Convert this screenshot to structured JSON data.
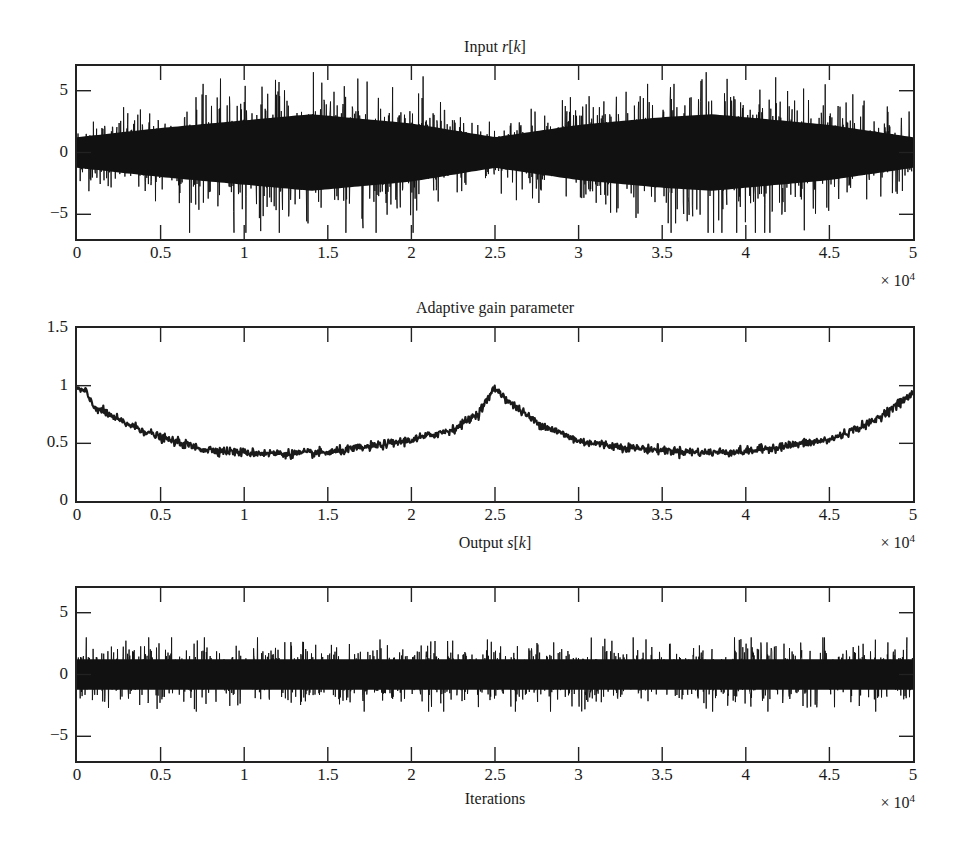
{
  "chart_data": [
    {
      "type": "line",
      "title": "Input r[k]",
      "title_parts": {
        "prefix": "Input ",
        "var": "r",
        "suffix_open": "[",
        "index": "k",
        "suffix_close": "]"
      },
      "xlabel": "",
      "ylabel": "",
      "x_multiplier": "× 10^4",
      "xlim": [
        0,
        5
      ],
      "ylim": [
        -7,
        7
      ],
      "xticks": [
        "0",
        "0.5",
        "1",
        "1.5",
        "2",
        "2.5",
        "3",
        "3.5",
        "4",
        "4.5",
        "5"
      ],
      "yticks": [
        "5",
        "0",
        "−5"
      ],
      "ytick_values": [
        5,
        0,
        -5
      ],
      "grid": false,
      "description": "Dense noise signal with amplitude envelope that grows to ~±5 near x=1.4 and x=3.7 (×10^4), shrinks to ~±2 near x=0, 2.5, 5",
      "envelope": {
        "x": [
          0,
          0.5,
          1.0,
          1.4,
          2.0,
          2.5,
          3.0,
          3.5,
          3.8,
          4.5,
          5.0
        ],
        "amplitude": [
          2.0,
          3.2,
          4.2,
          5.0,
          3.8,
          2.0,
          3.6,
          4.6,
          5.0,
          3.6,
          2.0
        ],
        "peak_max": 6.5,
        "peak_min": -6.3
      }
    },
    {
      "type": "line",
      "title": "Adaptive gain parameter",
      "xlabel": "",
      "ylabel": "",
      "x_multiplier": "× 10^4",
      "xlim": [
        0,
        5
      ],
      "ylim": [
        0,
        1.5
      ],
      "xticks": [
        "0",
        "0.5",
        "1",
        "1.5",
        "2",
        "2.5",
        "3",
        "3.5",
        "4",
        "4.5",
        "5"
      ],
      "yticks": [
        "1.5",
        "1",
        "0.5",
        "0"
      ],
      "ytick_values": [
        1.5,
        1,
        0.5,
        0
      ],
      "grid": false,
      "series": [
        {
          "name": "gain",
          "x": [
            0,
            0.05,
            0.1,
            0.25,
            0.5,
            0.75,
            1.0,
            1.25,
            1.5,
            1.75,
            2.0,
            2.25,
            2.4,
            2.5,
            2.6,
            2.75,
            3.0,
            3.25,
            3.5,
            3.75,
            4.0,
            4.25,
            4.5,
            4.75,
            5.0
          ],
          "values": [
            0.97,
            0.95,
            0.82,
            0.7,
            0.55,
            0.45,
            0.42,
            0.41,
            0.42,
            0.47,
            0.53,
            0.62,
            0.76,
            0.98,
            0.84,
            0.68,
            0.52,
            0.47,
            0.44,
            0.42,
            0.43,
            0.48,
            0.53,
            0.68,
            0.93
          ]
        }
      ]
    },
    {
      "type": "line",
      "title": "Output s[k]",
      "title_parts": {
        "prefix": "Output ",
        "var": "s",
        "suffix_open": "[",
        "index": "k",
        "suffix_close": "]"
      },
      "xlabel": "Iterations",
      "ylabel": "",
      "x_multiplier": "× 10^4",
      "xlim": [
        0,
        5
      ],
      "ylim": [
        -7,
        7
      ],
      "xticks": [
        "0",
        "0.5",
        "1",
        "1.5",
        "2",
        "2.5",
        "3",
        "3.5",
        "4",
        "4.5",
        "5"
      ],
      "yticks": [
        "5",
        "0",
        "−5"
      ],
      "ytick_values": [
        5,
        0,
        -5
      ],
      "grid": false,
      "description": "Roughly stationary noise with amplitude ~±2, occasional peaks near ±3",
      "envelope": {
        "x": [
          0,
          1,
          2,
          3,
          4,
          5
        ],
        "amplitude": [
          2.0,
          2.0,
          2.0,
          2.0,
          2.0,
          2.0
        ],
        "peak_max": 3.0,
        "peak_min": -3.0
      }
    }
  ],
  "labels": {
    "p1_title_prefix": "Input ",
    "p1_title_var": "r",
    "p1_title_open": "[",
    "p1_title_idx": "k",
    "p1_title_close": "]",
    "p2_title": "Adaptive gain parameter",
    "p3_title_prefix": "Output ",
    "p3_title_var": "s",
    "p3_title_open": "[",
    "p3_title_idx": "k",
    "p3_title_close": "]",
    "mult_base": "× 10",
    "mult_exp": "4",
    "xlabel3": "Iterations"
  },
  "xticks": [
    "0",
    "0.5",
    "1",
    "1.5",
    "2",
    "2.5",
    "3",
    "3.5",
    "4",
    "4.5",
    "5"
  ],
  "p1_yticks": [
    "5",
    "0",
    "−5"
  ],
  "p2_yticks": [
    "1.5",
    "1",
    "0.5",
    "0"
  ],
  "p3_yticks": [
    "5",
    "0",
    "−5"
  ]
}
